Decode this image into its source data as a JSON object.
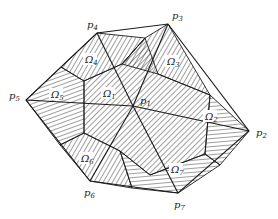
{
  "diagram": {
    "type": "control-volume mesh",
    "colors": {
      "line": "#1a1a1a",
      "hatch": "#2a2a2a",
      "background": "#ffffff"
    },
    "nodes": [
      {
        "id": "p1",
        "base": "p",
        "sub": "1",
        "x": 133,
        "y": 106,
        "lx": 140,
        "ly": 104
      },
      {
        "id": "p2",
        "base": "p",
        "sub": "2",
        "x": 249,
        "y": 131,
        "lx": 256,
        "ly": 136
      },
      {
        "id": "p3",
        "base": "p",
        "sub": "3",
        "x": 168,
        "y": 24,
        "lx": 173,
        "ly": 18
      },
      {
        "id": "p4",
        "base": "p",
        "sub": "4",
        "x": 97,
        "y": 33,
        "lx": 87,
        "ly": 27
      },
      {
        "id": "p5",
        "base": "p",
        "sub": "5",
        "x": 26,
        "y": 100,
        "lx": 10,
        "ly": 97
      },
      {
        "id": "p6",
        "base": "p",
        "sub": "6",
        "x": 90,
        "y": 181,
        "lx": 85,
        "ly": 196
      },
      {
        "id": "p7",
        "base": "p",
        "sub": "7",
        "x": 178,
        "y": 193,
        "lx": 175,
        "ly": 208
      }
    ],
    "regions": [
      {
        "id": "omega1",
        "base": "Ω",
        "sub": "1",
        "lx": 104,
        "ly": 96
      },
      {
        "id": "omega2",
        "base": "Ω",
        "sub": "2",
        "lx": 206,
        "ly": 119
      },
      {
        "id": "omega3",
        "base": "Ω",
        "sub": "3",
        "lx": 168,
        "ly": 64
      },
      {
        "id": "omega4",
        "base": "Ω",
        "sub": "4",
        "lx": 86,
        "ly": 62
      },
      {
        "id": "omega5",
        "base": "Ω",
        "sub": "5",
        "lx": 52,
        "ly": 97
      },
      {
        "id": "omega6",
        "base": "Ω",
        "sub": "6",
        "lx": 82,
        "ly": 161
      },
      {
        "id": "omega7",
        "base": "Ω",
        "sub": "7",
        "lx": 172,
        "ly": 172
      }
    ]
  }
}
